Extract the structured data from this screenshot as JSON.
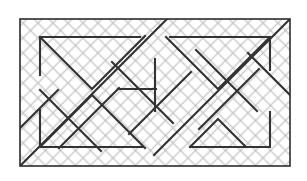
{
  "figure": {
    "canvas": {
      "width": 307,
      "height": 181,
      "background": "#ffffff"
    }
  },
  "style": {
    "background_color": "#ffffff",
    "hatch_color": "#b9b9b9",
    "hatch_stroke_width": 1,
    "hatch_pitch": 10.6,
    "border_color": "#2b2b2b",
    "border_stroke_width": 1.6,
    "pattern_color": "#333333",
    "pattern_stroke_width": 2.1
  },
  "frame": {
    "label": "outer-rectangle",
    "x": 20,
    "y": 19,
    "width": 270,
    "height": 147
  },
  "chart_data": {
    "type": "line",
    "xlabel": "",
    "ylabel": "",
    "xlim": [
      20,
      290
    ],
    "ylim": [
      19,
      166
    ],
    "grid": true,
    "legend": "none",
    "series": [
      {
        "name": "outer-frame",
        "kind": "rect",
        "points": [
          [
            20,
            19
          ],
          [
            290,
            19
          ],
          [
            290,
            166
          ],
          [
            20,
            166
          ],
          [
            20,
            19
          ]
        ]
      },
      {
        "name": "left-top-bracket",
        "kind": "polyline",
        "points": [
          [
            40,
            75
          ],
          [
            40,
            37
          ],
          [
            140,
            37
          ]
        ]
      },
      {
        "name": "left-bottom-bracket",
        "kind": "polyline",
        "points": [
          [
            40,
            110
          ],
          [
            40,
            147
          ],
          [
            143,
            147
          ]
        ]
      },
      {
        "name": "right-top-bracket",
        "kind": "polyline",
        "points": [
          [
            170,
            37
          ],
          [
            270,
            37
          ],
          [
            270,
            70
          ]
        ]
      },
      {
        "name": "right-bottom-bracket",
        "kind": "polyline",
        "points": [
          [
            270,
            112
          ],
          [
            270,
            147
          ],
          [
            190,
            147
          ]
        ]
      },
      {
        "name": "left-top-inner-chevron",
        "kind": "polyline",
        "points": [
          [
            40,
            37
          ],
          [
            92,
            90
          ],
          [
            145,
            37
          ]
        ]
      },
      {
        "name": "left-bottom-inner-chevron",
        "kind": "polyline",
        "points": [
          [
            40,
            147
          ],
          [
            92,
            94
          ],
          [
            145,
            147
          ]
        ]
      },
      {
        "name": "right-top-inner-chevron",
        "kind": "polyline",
        "points": [
          [
            165,
            37
          ],
          [
            218,
            90
          ],
          [
            270,
            37
          ]
        ]
      },
      {
        "name": "right-bottom-inner-chevron",
        "kind": "polyline",
        "points": [
          [
            190,
            147
          ],
          [
            218,
            119
          ],
          [
            246,
            147
          ]
        ]
      },
      {
        "name": "left-long-diagonal-down",
        "kind": "polyline",
        "points": [
          [
            20,
            166
          ],
          [
            167,
            19
          ]
        ]
      },
      {
        "name": "right-long-diagonal-up",
        "kind": "polyline",
        "points": [
          [
            290,
            19
          ],
          [
            155,
            154
          ]
        ]
      },
      {
        "name": "left-mid-diagonal-a",
        "kind": "polyline",
        "points": [
          [
            40,
            90
          ],
          [
            100,
            150
          ]
        ]
      },
      {
        "name": "left-mid-diagonal-b",
        "kind": "polyline",
        "points": [
          [
            60,
            147
          ],
          [
            118,
            89
          ]
        ]
      },
      {
        "name": "center-diagonal-a",
        "kind": "polyline",
        "points": [
          [
            112,
            62
          ],
          [
            172,
            122
          ]
        ]
      },
      {
        "name": "center-diagonal-b",
        "kind": "polyline",
        "points": [
          [
            130,
            133
          ],
          [
            190,
            73
          ]
        ]
      },
      {
        "name": "right-mid-diagonal-a",
        "kind": "polyline",
        "points": [
          [
            196,
            50
          ],
          [
            256,
            110
          ]
        ]
      },
      {
        "name": "right-mid-diagonal-b",
        "kind": "polyline",
        "points": [
          [
            200,
            128
          ],
          [
            258,
            70
          ]
        ]
      },
      {
        "name": "center-vertical-upper",
        "kind": "polyline",
        "points": [
          [
            155,
            60
          ],
          [
            155,
            110
          ]
        ]
      },
      {
        "name": "center-horizontal-upper",
        "kind": "polyline",
        "points": [
          [
            118,
            89
          ],
          [
            155,
            89
          ]
        ]
      }
    ]
  },
  "pattern_lines": [
    {
      "name": "frame-top",
      "x1": 20,
      "y1": 19,
      "x2": 290,
      "y2": 19,
      "weight": "border"
    },
    {
      "name": "frame-right",
      "x1": 290,
      "y1": 19,
      "x2": 290,
      "y2": 166,
      "weight": "border"
    },
    {
      "name": "frame-bottom",
      "x1": 290,
      "y1": 166,
      "x2": 20,
      "y2": 166,
      "weight": "border"
    },
    {
      "name": "frame-left",
      "x1": 20,
      "y1": 166,
      "x2": 20,
      "y2": 19,
      "weight": "border"
    }
  ]
}
